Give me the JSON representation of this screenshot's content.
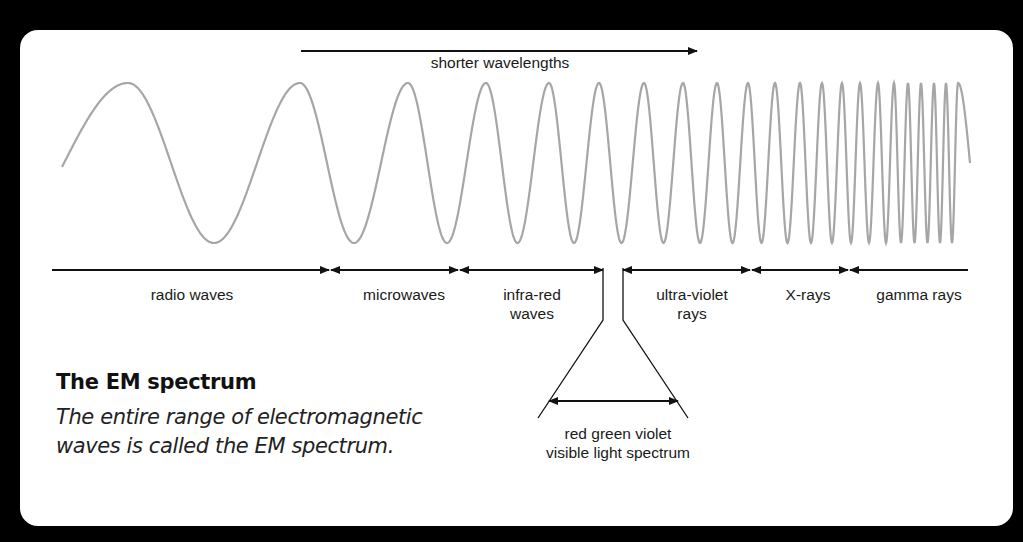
{
  "diagram": {
    "title": "The EM spectrum",
    "description_line1": "The entire range of electromagnetic",
    "description_line2": "waves is called the EM spectrum.",
    "direction_arrow_label": "shorter wavelengths",
    "regions": [
      {
        "label_line1": "radio waves",
        "label_line2": ""
      },
      {
        "label_line1": "microwaves",
        "label_line2": ""
      },
      {
        "label_line1": "infra-red",
        "label_line2": "waves"
      },
      {
        "label_line1": "ultra-violet",
        "label_line2": "rays"
      },
      {
        "label_line1": "X-rays",
        "label_line2": ""
      },
      {
        "label_line1": "gamma rays",
        "label_line2": ""
      }
    ],
    "visible_light": {
      "label_line1": "red green violet",
      "label_line2": "visible light spectrum"
    },
    "colors": {
      "background": "#000000",
      "card": "#ffffff",
      "wave": "#a6a6a6",
      "lines": "#111111"
    }
  }
}
